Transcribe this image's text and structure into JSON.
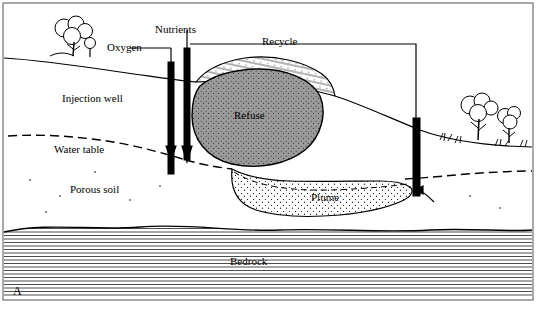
{
  "figure": {
    "panel_label": "A",
    "labels": {
      "nutrients": "Nutrients",
      "oxygen": "Oxygen",
      "recycle": "Recycle",
      "injection_well": "Injection well",
      "water_table": "Water table",
      "porous_soil": "Porous soil",
      "refuse": "Refuse",
      "plume": "Plume",
      "bedrock": "Bedrock"
    },
    "colors": {
      "stroke": "#000000",
      "background": "#ffffff",
      "refuse_fill": "#9a9a9a",
      "border": "#555555"
    }
  }
}
